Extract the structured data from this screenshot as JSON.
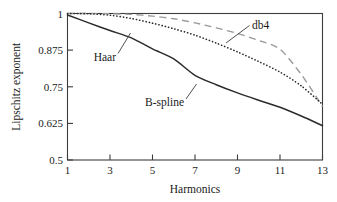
{
  "chart_data": {
    "type": "line",
    "title": "",
    "xlabel": "Harmonics",
    "ylabel": "Lipschitz exponent",
    "xlim": [
      1,
      13
    ],
    "ylim": [
      0.5,
      1.0
    ],
    "grid": false,
    "legend_position": "inline-annotations",
    "x_ticks": [
      "1",
      "3",
      "5",
      "7",
      "9",
      "11",
      "13"
    ],
    "x_tick_values": [
      1,
      3,
      5,
      7,
      9,
      11,
      13
    ],
    "y_ticks": [
      "0.5",
      "0.625",
      "0.75",
      "0.875",
      "1"
    ],
    "y_tick_values": [
      0.5,
      0.625,
      0.75,
      0.875,
      1
    ],
    "x": [
      1,
      2,
      3,
      4,
      5,
      6,
      7,
      8,
      9,
      10,
      11,
      12,
      13
    ],
    "series": [
      {
        "name": "B-spline",
        "style": "solid",
        "color": "#2b2b2b",
        "values": [
          0.995,
          0.968,
          0.942,
          0.917,
          0.879,
          0.845,
          0.789,
          0.757,
          0.729,
          0.704,
          0.68,
          0.65,
          0.617
        ]
      },
      {
        "name": "Haar",
        "style": "dotted",
        "color": "#2b2b2b",
        "values": [
          1.0,
          0.999,
          0.994,
          0.983,
          0.967,
          0.948,
          0.926,
          0.899,
          0.869,
          0.836,
          0.8,
          0.753,
          0.69
        ]
      },
      {
        "name": "db4",
        "style": "dashed",
        "color": "#9a9a9a",
        "values": [
          1.0,
          1.0,
          0.999,
          0.997,
          0.991,
          0.982,
          0.968,
          0.951,
          0.932,
          0.908,
          0.878,
          0.792,
          0.683
        ]
      }
    ],
    "annotations": [
      {
        "label": "Haar",
        "target_series": "Haar"
      },
      {
        "label": "db4",
        "target_series": "db4"
      },
      {
        "label": "B-spline",
        "target_series": "B-spline"
      }
    ]
  }
}
